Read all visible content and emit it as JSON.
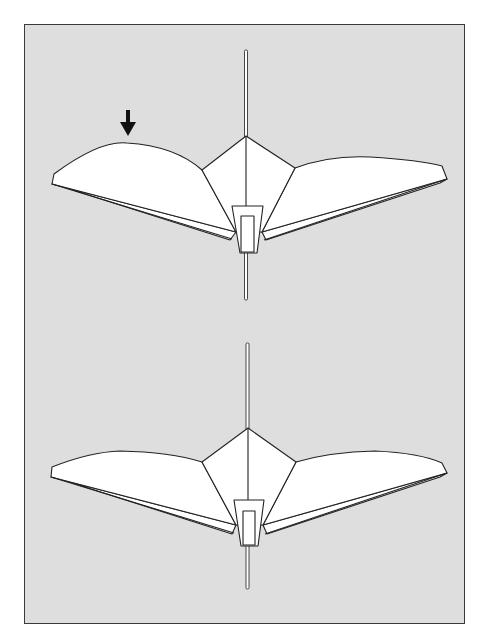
{
  "diagram": {
    "type": "illustration",
    "colors": {
      "background": "#dedede",
      "paper": "#ffffff",
      "outline": "#222222",
      "frame_border": "#3a3a3a",
      "arrow": "#111111"
    },
    "figures": [
      {
        "id": "top",
        "label": "left wing raised",
        "annotation": "down-arrow-above-left-wing"
      },
      {
        "id": "bottom",
        "label": "wings level"
      }
    ]
  }
}
